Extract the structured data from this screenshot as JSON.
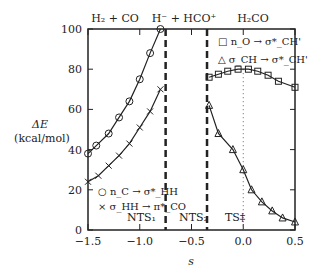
{
  "chart_data": {
    "type": "line",
    "xlabel": "s_IRC",
    "ylabel": "ΔE_DA^(2) (kcal/mol)",
    "xlim": [
      -1.5,
      0.5
    ],
    "ylim": [
      0,
      100
    ],
    "xticks": [
      "-1.5",
      "-1.0",
      "-0.5",
      "0.0",
      "0.5"
    ],
    "yticks": [
      "0",
      "20",
      "40",
      "60",
      "80",
      "100"
    ],
    "region_labels": [
      "H₂ + CO",
      "H⁻ + HCO⁺",
      "H₂CO"
    ],
    "markers": [
      "NTS₁",
      "NTS₂",
      "TS‡"
    ],
    "dividers": [
      -0.75,
      -0.35
    ],
    "ts_line": 0.0,
    "series": [
      {
        "name": "n_C → σ*_HH",
        "marker": "circle",
        "x": [
          -1.5,
          -1.42,
          -1.3,
          -1.2,
          -1.1,
          -1.0,
          -0.9,
          -0.8
        ],
        "y": [
          38,
          42,
          48,
          56,
          64,
          75,
          88,
          100
        ]
      },
      {
        "name": "σ_HH → π*_CO",
        "marker": "x",
        "x": [
          -1.5,
          -1.4,
          -1.3,
          -1.2,
          -1.1,
          -1.0,
          -0.9,
          -0.8
        ],
        "y": [
          24,
          27,
          32,
          37,
          43,
          51,
          59,
          70
        ]
      },
      {
        "name": "n_O → σ*_CH'",
        "marker": "square",
        "x": [
          -0.33,
          -0.24,
          -0.15,
          -0.05,
          0.05,
          0.14,
          0.24,
          0.34,
          0.5
        ],
        "y": [
          76,
          77.5,
          79,
          80,
          80,
          79,
          77,
          74,
          71
        ]
      },
      {
        "name": "σ_CH → σ*_CH'",
        "marker": "triangle",
        "x": [
          -0.33,
          -0.24,
          -0.1,
          0.0,
          0.08,
          0.18,
          0.28,
          0.38,
          0.5
        ],
        "y": [
          62,
          48,
          40,
          30,
          20,
          14,
          9.5,
          6,
          4
        ]
      }
    ]
  }
}
